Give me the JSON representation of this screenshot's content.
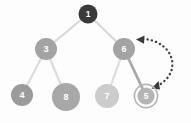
{
  "diagram": {
    "background_color": "#fdfdfd",
    "colors": {
      "root_node": "#3a3a3a",
      "node_mid": "#9a9a9a",
      "node_light": "#c9c9c9",
      "node_lighter": "#d6d6d6",
      "edge_light": "#d8d8d8",
      "edge_highlight": "#a8a8a8",
      "arrow_dotted": "#3a3a3a",
      "highlight_ring": "#b4b4b4",
      "label_text": "#ffffff"
    },
    "nodes": [
      {
        "id": "n1",
        "label": "1",
        "cx": 88,
        "cy": 14,
        "r": 9.5,
        "fill": "#3a3a3a",
        "highlighted": false
      },
      {
        "id": "n3",
        "label": "3",
        "cx": 46,
        "cy": 49,
        "r": 11,
        "fill": "#a3a3a3",
        "highlighted": false
      },
      {
        "id": "n6",
        "label": "6",
        "cx": 124,
        "cy": 49,
        "r": 11,
        "fill": "#a3a3a3",
        "highlighted": false
      },
      {
        "id": "n4",
        "label": "4",
        "cx": 22,
        "cy": 95,
        "r": 11,
        "fill": "#9b9b9b",
        "highlighted": false
      },
      {
        "id": "n8",
        "label": "8",
        "cx": 66,
        "cy": 97,
        "r": 14,
        "fill": "#a8a8a8",
        "highlighted": false
      },
      {
        "id": "n7",
        "label": "7",
        "cx": 107,
        "cy": 96,
        "r": 12,
        "fill": "#cccccc",
        "highlighted": false
      },
      {
        "id": "n5",
        "label": "5",
        "cx": 146,
        "cy": 96,
        "r": 10,
        "fill": "#b5b5b5",
        "highlighted": true
      }
    ],
    "edges": [
      {
        "from": "n1",
        "to": "n3",
        "color": "#d8d8d8",
        "width": 2.2,
        "highlighted": false
      },
      {
        "from": "n1",
        "to": "n6",
        "color": "#d8d8d8",
        "width": 2.2,
        "highlighted": false
      },
      {
        "from": "n3",
        "to": "n4",
        "color": "#dcdcdc",
        "width": 2.2,
        "highlighted": false
      },
      {
        "from": "n3",
        "to": "n8",
        "color": "#dcdcdc",
        "width": 2.2,
        "highlighted": false
      },
      {
        "from": "n6",
        "to": "n7",
        "color": "#dedede",
        "width": 2.2,
        "highlighted": false
      },
      {
        "from": "n6",
        "to": "n5",
        "color": "#a9a9a9",
        "width": 2.8,
        "highlighted": true
      }
    ],
    "annotation": {
      "name": "swap-arc",
      "style": "dotted",
      "color": "#3a3a3a",
      "double_headed": true,
      "connects": [
        "n6",
        "n5"
      ],
      "head_top": {
        "x": 139,
        "y": 39,
        "direction": "left"
      },
      "head_bottom": {
        "x": 156,
        "y": 85,
        "direction": "down-left"
      }
    }
  }
}
